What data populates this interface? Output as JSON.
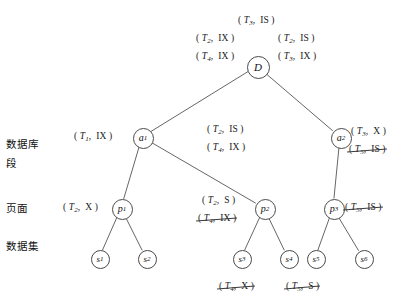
{
  "diagram": {
    "side_labels": [
      {
        "name": "database",
        "text": "数据库",
        "x": 6,
        "y": 136
      },
      {
        "name": "segment",
        "text": "段",
        "x": 6,
        "y": 155
      },
      {
        "name": "page",
        "text": "页面",
        "x": 6,
        "y": 200
      },
      {
        "name": "dataset",
        "text": "数据集",
        "x": 6,
        "y": 238
      }
    ],
    "nodes": [
      {
        "id": "D",
        "label": "D",
        "sub": "",
        "kind": "d",
        "cx": 257,
        "cy": 66
      },
      {
        "id": "a1",
        "label": "a",
        "sub": "1",
        "kind": "a",
        "cx": 142,
        "cy": 137
      },
      {
        "id": "a2",
        "label": "a",
        "sub": "2",
        "kind": "a",
        "cx": 340,
        "cy": 137
      },
      {
        "id": "p1",
        "label": "p",
        "sub": "1",
        "kind": "p",
        "cx": 121,
        "cy": 208
      },
      {
        "id": "p2",
        "label": "p",
        "sub": "2",
        "kind": "p",
        "cx": 264,
        "cy": 208
      },
      {
        "id": "p3",
        "label": "p",
        "sub": "3",
        "kind": "p",
        "cx": 333,
        "cy": 208
      },
      {
        "id": "s1",
        "label": "s",
        "sub": "1",
        "kind": "s",
        "cx": 99,
        "cy": 258
      },
      {
        "id": "s2",
        "label": "s",
        "sub": "2",
        "kind": "s",
        "cx": 146,
        "cy": 258
      },
      {
        "id": "s3",
        "label": "s",
        "sub": "3",
        "kind": "s",
        "cx": 241,
        "cy": 258
      },
      {
        "id": "s4",
        "label": "s",
        "sub": "4",
        "kind": "s",
        "cx": 288,
        "cy": 258
      },
      {
        "id": "s5",
        "label": "s",
        "sub": "5",
        "kind": "s",
        "cx": 315,
        "cy": 258
      },
      {
        "id": "s6",
        "label": "s",
        "sub": "6",
        "kind": "s",
        "cx": 363,
        "cy": 258
      }
    ],
    "edges": [
      {
        "from": "D",
        "to": "a1"
      },
      {
        "from": "D",
        "to": "a2"
      },
      {
        "from": "a1",
        "to": "p1"
      },
      {
        "from": "a1",
        "to": "p2"
      },
      {
        "from": "a2",
        "to": "p3"
      },
      {
        "from": "p1",
        "to": "s1"
      },
      {
        "from": "p1",
        "to": "s2"
      },
      {
        "from": "p2",
        "to": "s3"
      },
      {
        "from": "p2",
        "to": "s4"
      },
      {
        "from": "p3",
        "to": "s5"
      },
      {
        "from": "p3",
        "to": "s6"
      }
    ],
    "lock_labels": [
      {
        "name": "lock-d-top",
        "txn": "T",
        "sub": "3",
        "mode": "IS",
        "struck": false,
        "x": 238,
        "y": 15,
        "attached": "D"
      },
      {
        "name": "lock-d-left-1",
        "txn": "T",
        "sub": "2",
        "mode": "IX",
        "struck": false,
        "x": 196,
        "y": 33,
        "attached": "D"
      },
      {
        "name": "lock-d-left-2",
        "txn": "T",
        "sub": "4",
        "mode": "IX",
        "struck": false,
        "x": 196,
        "y": 51,
        "attached": "D"
      },
      {
        "name": "lock-d-right-1",
        "txn": "T",
        "sub": "2",
        "mode": "IS",
        "struck": false,
        "x": 278,
        "y": 33,
        "attached": "D"
      },
      {
        "name": "lock-d-right-2",
        "txn": "T",
        "sub": "3",
        "mode": "IX",
        "struck": false,
        "x": 278,
        "y": 51,
        "attached": "D"
      },
      {
        "name": "lock-a1-left",
        "txn": "T",
        "sub": "1",
        "mode": "IX",
        "struck": false,
        "x": 74,
        "y": 131,
        "attached": "a1"
      },
      {
        "name": "lock-a1-right-1",
        "txn": "T",
        "sub": "2",
        "mode": "IS",
        "struck": false,
        "x": 207,
        "y": 124,
        "attached": "a1"
      },
      {
        "name": "lock-a1-right-2",
        "txn": "T",
        "sub": "4",
        "mode": "IX",
        "struck": false,
        "x": 207,
        "y": 142,
        "attached": "a1"
      },
      {
        "name": "lock-a2-right-1",
        "txn": "T",
        "sub": "3",
        "mode": "X",
        "struck": false,
        "x": 351,
        "y": 126,
        "attached": "a2"
      },
      {
        "name": "lock-a2-right-2",
        "txn": "T",
        "sub": "5",
        "mode": "IS",
        "struck": true,
        "x": 349,
        "y": 144,
        "attached": "a2"
      },
      {
        "name": "lock-p1-left",
        "txn": "T",
        "sub": "2",
        "mode": "X",
        "struck": false,
        "x": 63,
        "y": 202,
        "attached": "p1"
      },
      {
        "name": "lock-p2-left-1",
        "txn": "T",
        "sub": "2",
        "mode": "S",
        "struck": false,
        "x": 202,
        "y": 195,
        "attached": "p2"
      },
      {
        "name": "lock-p2-left-2",
        "txn": "T",
        "sub": "4",
        "mode": "IX",
        "struck": true,
        "x": 198,
        "y": 213,
        "attached": "p2"
      },
      {
        "name": "lock-p3-right",
        "txn": "T",
        "sub": "5",
        "mode": "IS",
        "struck": true,
        "x": 345,
        "y": 202,
        "attached": "p3"
      },
      {
        "name": "lock-s3-below",
        "txn": "T",
        "sub": "4",
        "mode": "X",
        "struck": true,
        "x": 219,
        "y": 281,
        "attached": "s3"
      },
      {
        "name": "lock-s45-below",
        "txn": "T",
        "sub": "5",
        "mode": "S",
        "struck": true,
        "x": 286,
        "y": 281,
        "attached": "s4"
      }
    ]
  }
}
